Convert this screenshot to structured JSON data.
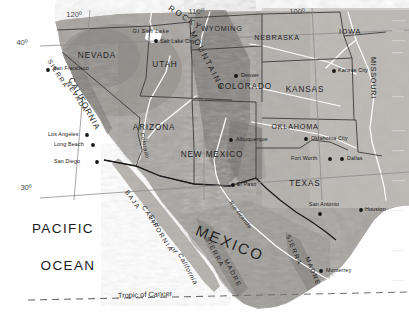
{
  "map": {
    "title": "Southwestern United States and Northern Mexico",
    "projection_note": "shaded relief with political boundaries",
    "palette": {
      "land_light": "#b9b7b2",
      "land_mid": "#9d9a95",
      "land_dark": "#7d7a75",
      "highland": "#6d6a66",
      "lowland": "#c9c7c2",
      "ocean": "#ffffff",
      "water_body": "#ffffff",
      "border_state": "#3a3a3a",
      "border_country": "#1a1a1a",
      "river": "#ffffff",
      "graticule": "#8a8a8a",
      "tropic_line": "#6e6e6e",
      "label": "#1c1c1c"
    }
  },
  "graticule": {
    "labels": [
      {
        "id": "lon-120",
        "text": "120º",
        "x": 74,
        "y": 17
      },
      {
        "id": "lon-110",
        "text": "110º",
        "x": 196,
        "y": 14
      },
      {
        "id": "lon-100",
        "text": "100º",
        "x": 297,
        "y": 14
      },
      {
        "id": "lat-40",
        "text": "40º",
        "x": 22,
        "y": 45
      },
      {
        "id": "lat-30",
        "text": "30º",
        "x": 26,
        "y": 190
      }
    ]
  },
  "tropic": {
    "label": "Tropic of Cancer",
    "x": 118,
    "y": 298
  },
  "states": [
    {
      "name": "NEVADA",
      "x": 97,
      "y": 58,
      "rot": 0,
      "size": "state"
    },
    {
      "name": "UTAH",
      "x": 165,
      "y": 67,
      "rot": 0,
      "size": "state"
    },
    {
      "name": "CALIFORNIA",
      "x": 82,
      "y": 105,
      "rot": 62,
      "size": "state"
    },
    {
      "name": "ARIZONA",
      "x": 154,
      "y": 130,
      "rot": 0,
      "size": "state"
    },
    {
      "name": "NEW MEXICO",
      "x": 212,
      "y": 157,
      "rot": 0,
      "size": "state"
    },
    {
      "name": "COLORADO",
      "x": 245,
      "y": 89,
      "rot": 0,
      "size": "state"
    },
    {
      "name": "WYOMING",
      "x": 222,
      "y": 31,
      "rot": 0,
      "size": "state-sm"
    },
    {
      "name": "NEBRASKA",
      "x": 277,
      "y": 40,
      "rot": 0,
      "size": "state-sm"
    },
    {
      "name": "IOWA",
      "x": 350,
      "y": 34,
      "rot": 0,
      "size": "state-sm"
    },
    {
      "name": "KANSAS",
      "x": 305,
      "y": 92,
      "rot": 0,
      "size": "state"
    },
    {
      "name": "MISSOURI",
      "x": 371,
      "y": 78,
      "rot": 90,
      "size": "state-sm"
    },
    {
      "name": "OKLAHOMA",
      "x": 295,
      "y": 129,
      "rot": 0,
      "size": "state-sm"
    },
    {
      "name": "TEXAS",
      "x": 305,
      "y": 186,
      "rot": 0,
      "size": "state"
    }
  ],
  "country_labels": [
    {
      "name": "MEXICO",
      "x": 228,
      "y": 248,
      "rot": 22
    }
  ],
  "ocean_labels": [
    {
      "name": "PACIFIC",
      "x": 63,
      "y": 233
    },
    {
      "name": "OCEAN",
      "x": 68,
      "y": 270
    }
  ],
  "water_labels": [
    {
      "name": "Gulf",
      "x": 152,
      "y": 222,
      "rot": 62
    },
    {
      "name": "of",
      "x": 172,
      "y": 251,
      "rot": 62
    },
    {
      "name": "California",
      "x": 186,
      "y": 270,
      "rot": 62
    },
    {
      "name": "Gt Salt Lake",
      "x": 151,
      "y": 33,
      "rot": 0,
      "cls": "water-sm"
    },
    {
      "name": "Rio Grande",
      "x": 239,
      "y": 216,
      "rot": 52,
      "cls": "water-sm"
    },
    {
      "name": "Colorado",
      "x": 143,
      "y": 146,
      "rot": 78,
      "cls": "water-sm"
    }
  ],
  "ranges": [
    {
      "name": "ROCKY",
      "x": 184,
      "y": 20,
      "rot": 33,
      "cls": "range-lg"
    },
    {
      "name": "MOUNTAINS",
      "x": 205,
      "y": 62,
      "rot": 62,
      "cls": "range-lg"
    },
    {
      "name": "SIERRA",
      "x": 56,
      "y": 75,
      "rot": 58,
      "cls": "range"
    },
    {
      "name": "NEVADA",
      "x": 75,
      "y": 98,
      "rot": 58,
      "cls": "range"
    },
    {
      "name": "BAJA",
      "x": 131,
      "y": 201,
      "rot": 55,
      "cls": "range"
    },
    {
      "name": "CALIFORNIA",
      "x": 156,
      "y": 230,
      "rot": 58,
      "cls": "range"
    },
    {
      "name": "SIERRA",
      "x": 213,
      "y": 253,
      "rot": 62,
      "cls": "range"
    },
    {
      "name": "MADRE",
      "x": 231,
      "y": 274,
      "rot": 62,
      "cls": "range"
    },
    {
      "name": "SIERRA",
      "x": 292,
      "y": 251,
      "rot": 68,
      "cls": "range"
    },
    {
      "name": "MADRE",
      "x": 311,
      "y": 272,
      "rot": 68,
      "cls": "range"
    }
  ],
  "cities": [
    {
      "name": "San Francisco",
      "x": 53,
      "y": 70,
      "dot_x": 48,
      "dot_y": 70,
      "anchor": "start",
      "dot_side": "left"
    },
    {
      "name": "Salt Lake City",
      "x": 160,
      "y": 43,
      "dot_x": 156,
      "dot_y": 41,
      "anchor": "start",
      "dot_side": "left"
    },
    {
      "name": "Denver",
      "x": 241,
      "y": 77,
      "dot_x": 236,
      "dot_y": 76,
      "anchor": "start",
      "dot_side": "left"
    },
    {
      "name": "Kansas City",
      "x": 338,
      "y": 72,
      "dot_x": 334,
      "dot_y": 71,
      "anchor": "start",
      "dot_side": "left"
    },
    {
      "name": "Los Angeles",
      "x": 48,
      "y": 136,
      "dot_x": 87,
      "dot_y": 135,
      "anchor": "start",
      "dot_side": "right"
    },
    {
      "name": "Long Beach",
      "x": 54,
      "y": 146,
      "dot_x": 93,
      "dot_y": 145,
      "anchor": "start",
      "dot_side": "right"
    },
    {
      "name": "San Diego",
      "x": 54,
      "y": 163,
      "dot_x": 97,
      "dot_y": 162,
      "anchor": "start",
      "dot_side": "right"
    },
    {
      "name": "Albuquerque",
      "x": 236,
      "y": 141,
      "dot_x": 231,
      "dot_y": 140,
      "anchor": "start",
      "dot_side": "left"
    },
    {
      "name": "El Paso",
      "x": 237,
      "y": 186,
      "dot_x": 233,
      "dot_y": 185,
      "anchor": "start",
      "dot_side": "left"
    },
    {
      "name": "Oklahoma City",
      "x": 311,
      "y": 140,
      "dot_x": 306,
      "dot_y": 139,
      "anchor": "start",
      "dot_side": "left"
    },
    {
      "name": "Fort Worth",
      "x": 291,
      "y": 160,
      "dot_x": 330,
      "dot_y": 159,
      "anchor": "start",
      "dot_side": "right"
    },
    {
      "name": "Dallas",
      "x": 347,
      "y": 160,
      "dot_x": 342,
      "dot_y": 159,
      "anchor": "start",
      "dot_side": "left"
    },
    {
      "name": "San Antonio",
      "x": 309,
      "y": 206,
      "dot_x": 320,
      "dot_y": 214,
      "anchor": "start",
      "dot_side": "below"
    },
    {
      "name": "Houston",
      "x": 365,
      "y": 211,
      "dot_x": 361,
      "dot_y": 210,
      "anchor": "start",
      "dot_side": "left"
    },
    {
      "name": "Monterrey",
      "x": 326,
      "y": 272,
      "dot_x": 321,
      "dot_y": 271,
      "anchor": "start",
      "dot_side": "left"
    }
  ]
}
